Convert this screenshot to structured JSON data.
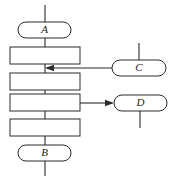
{
  "diagram": {
    "type": "flowchart",
    "width": 172,
    "height": 180,
    "background_color": "#ffffff",
    "stroke_color": "#2b2b2b",
    "fill_color": "#ffffff",
    "nodes": [
      {
        "id": "A",
        "label": "A",
        "shape": "stadium",
        "x": 18,
        "y": 22,
        "width": 53,
        "height": 16,
        "cx": 44.5,
        "cy": 30
      },
      {
        "id": "P1",
        "label": "",
        "shape": "rectangle",
        "x": 10,
        "y": 47,
        "width": 70,
        "height": 17,
        "cx": 45,
        "cy": 55.5
      },
      {
        "id": "P2",
        "label": "",
        "shape": "rectangle",
        "x": 10,
        "y": 73,
        "width": 70,
        "height": 17,
        "cx": 45,
        "cy": 81.5
      },
      {
        "id": "P3",
        "label": "",
        "shape": "rectangle",
        "x": 10,
        "y": 94,
        "width": 70,
        "height": 17,
        "cx": 45,
        "cy": 102.5
      },
      {
        "id": "P4",
        "label": "",
        "shape": "rectangle",
        "x": 10,
        "y": 119,
        "width": 70,
        "height": 17,
        "cx": 45,
        "cy": 127.5
      },
      {
        "id": "B",
        "label": "B",
        "shape": "stadium",
        "x": 18,
        "y": 145,
        "width": 53,
        "height": 16,
        "cx": 44.5,
        "cy": 153
      },
      {
        "id": "C",
        "label": "C",
        "shape": "stadium",
        "x": 112,
        "y": 60,
        "width": 54,
        "height": 16,
        "cx": 139,
        "cy": 68
      },
      {
        "id": "D",
        "label": "D",
        "shape": "stadium",
        "x": 114,
        "y": 95,
        "width": 53,
        "height": 16,
        "cx": 140.5,
        "cy": 103
      }
    ],
    "connections": [
      {
        "id": "spine-top",
        "from": "top-edge",
        "to": "A",
        "x1": 45,
        "y1": 5,
        "x2": 45,
        "y2": 22,
        "arrow": "none"
      },
      {
        "id": "a-to-p1",
        "from": "A",
        "to": "P1",
        "x1": 45,
        "y1": 38,
        "x2": 45,
        "y2": 47,
        "arrow": "none"
      },
      {
        "id": "p1-to-p2",
        "from": "P1",
        "to": "P2",
        "x1": 45,
        "y1": 64,
        "x2": 45,
        "y2": 73,
        "arrow": "none"
      },
      {
        "id": "p2-to-p3",
        "from": "P2",
        "to": "P3",
        "x1": 45,
        "y1": 90,
        "x2": 45,
        "y2": 94,
        "arrow": "none"
      },
      {
        "id": "p3-to-p4",
        "from": "P3",
        "to": "P4",
        "x1": 45,
        "y1": 111,
        "x2": 45,
        "y2": 119,
        "arrow": "none"
      },
      {
        "id": "p4-to-b",
        "from": "P4",
        "to": "B",
        "x1": 45,
        "y1": 136,
        "x2": 45,
        "y2": 145,
        "arrow": "none"
      },
      {
        "id": "spine-bottom",
        "from": "B",
        "to": "bottom-edge",
        "x1": 45,
        "y1": 161,
        "x2": 45,
        "y2": 176,
        "arrow": "none"
      },
      {
        "id": "c-to-spine",
        "from": "C",
        "to": "spine",
        "x1": 112,
        "y1": 68,
        "x2": 45,
        "y2": 68,
        "arrow": "left"
      },
      {
        "id": "c-stub-up",
        "from": "top-edge",
        "to": "C",
        "x1": 139,
        "y1": 43,
        "x2": 139,
        "y2": 60,
        "arrow": "none"
      },
      {
        "id": "p3-to-d",
        "from": "P3",
        "to": "D",
        "x1": 80,
        "y1": 103,
        "x2": 114,
        "y2": 103,
        "arrow": "right"
      },
      {
        "id": "d-stub-down",
        "from": "D",
        "to": "bottom-edge",
        "x1": 140,
        "y1": 111,
        "x2": 140,
        "y2": 128,
        "arrow": "none"
      }
    ]
  }
}
